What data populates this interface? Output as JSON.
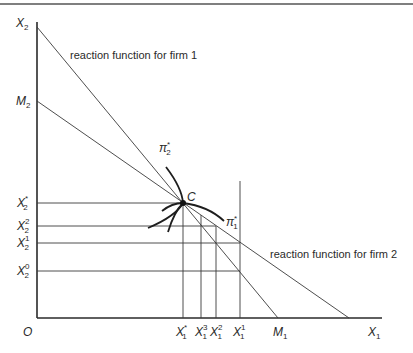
{
  "figure": {
    "type": "cournot-reaction-diagram",
    "border_top": true
  },
  "axes": {
    "origin_label": "O",
    "x_axis_label": {
      "main": "X",
      "sub": "1"
    },
    "y_axis_label": {
      "main": "X",
      "sub": "2"
    }
  },
  "y_ticks": [
    {
      "main": "M",
      "sub": "2",
      "sup": ""
    },
    {
      "main": "X",
      "sub": "2",
      "sup": "*"
    },
    {
      "main": "X",
      "sub": "2",
      "sup": "2"
    },
    {
      "main": "X",
      "sub": "2",
      "sup": "1"
    },
    {
      "main": "X",
      "sub": "2",
      "sup": "0"
    }
  ],
  "x_ticks": [
    {
      "main": "X",
      "sub": "1",
      "sup": "*"
    },
    {
      "main": "X",
      "sub": "1",
      "sup": "3"
    },
    {
      "main": "X",
      "sub": "1",
      "sup": "2"
    },
    {
      "main": "X",
      "sub": "1",
      "sup": "1"
    },
    {
      "main": "M",
      "sub": "1",
      "sup": ""
    }
  ],
  "annotations": {
    "reaction_firm1": "reaction function for firm 1",
    "reaction_firm2": "reaction function for firm 2",
    "equilibrium_point": "C",
    "isoprofit_firm2": {
      "main": "π",
      "sub": "2",
      "sup": "*"
    },
    "isoprofit_firm1": {
      "main": "π",
      "sub": "1",
      "sup": "*"
    }
  },
  "colors": {
    "line": "#3a3a3a",
    "text": "#2a2a2a",
    "background": "#ffffff"
  }
}
